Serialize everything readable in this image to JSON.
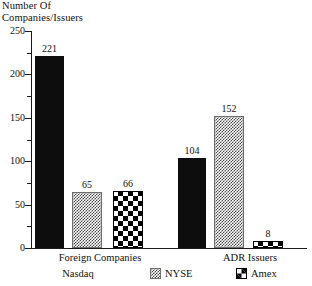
{
  "chart_data": {
    "type": "bar",
    "title": "",
    "ylabel": "Number Of\nCompanies/Issuers",
    "xlabel": "",
    "categories": [
      "Foreign Companies",
      "ADR Issuers"
    ],
    "series": [
      {
        "name": "Nasdaq",
        "values": [
          221,
          104
        ],
        "pattern": "solid-black",
        "color": "#0d0d0d"
      },
      {
        "name": "NYSE",
        "values": [
          65,
          152
        ],
        "pattern": "fine-gray-dither",
        "color": "#4a4a4a"
      },
      {
        "name": "Amex",
        "values": [
          66,
          8
        ],
        "pattern": "black-white-checkerboard",
        "color": "#000000"
      }
    ],
    "ylim": [
      0,
      250
    ],
    "yticks": [
      0,
      50,
      100,
      150,
      200,
      250
    ],
    "yticks_minor": [
      25,
      75,
      125,
      175,
      225
    ],
    "ytick_labels": [
      "0",
      "50",
      "100",
      "150",
      "200",
      "250"
    ],
    "grid": false,
    "legend_position": "bottom",
    "data_labels": [
      "221",
      "65",
      "66",
      "104",
      "152",
      "8"
    ]
  },
  "axis": {
    "title_line1": "Number Of",
    "title_line2": "Companies/Issuers",
    "title": "Number Of\nCompanies/Issuers",
    "ticks": [
      {
        "value": 250,
        "label": "250"
      },
      {
        "value": 200,
        "label": "200"
      },
      {
        "value": 150,
        "label": "150"
      },
      {
        "value": 100,
        "label": "100"
      },
      {
        "value": 50,
        "label": "50"
      },
      {
        "value": 0,
        "label": "0"
      }
    ]
  },
  "groups": [
    {
      "label": "Foreign Companies"
    },
    {
      "label": "ADR Issuers"
    }
  ],
  "bars": [
    {
      "label": "221",
      "series": "Nasdaq",
      "group": "Foreign Companies",
      "value": 221
    },
    {
      "label": "65",
      "series": "NYSE",
      "group": "Foreign Companies",
      "value": 65
    },
    {
      "label": "66",
      "series": "Amex",
      "group": "Foreign Companies",
      "value": 66
    },
    {
      "label": "104",
      "series": "Nasdaq",
      "group": "ADR Issuers",
      "value": 104
    },
    {
      "label": "152",
      "series": "NYSE",
      "group": "ADR Issuers",
      "value": 152
    },
    {
      "label": "8",
      "series": "Amex",
      "group": "ADR Issuers",
      "value": 8
    }
  ],
  "legend": [
    {
      "label": "Nasdaq",
      "swatch": "solid-black-swatch"
    },
    {
      "label": "NYSE",
      "swatch": "gray-dither-swatch"
    },
    {
      "label": "Amex",
      "swatch": "checkerboard-swatch"
    }
  ]
}
